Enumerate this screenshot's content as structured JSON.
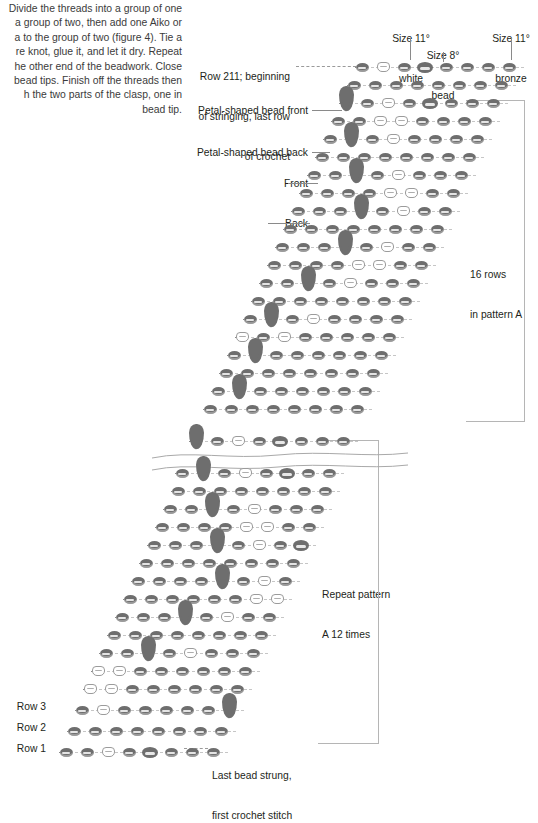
{
  "figure": {
    "instruction_paragraph": "Divide the threads into a group of one and a group of two, then add one Aiko or Delica to the group of two (figure 4). Tie a square knot, glue it, and let it dry. Repeat on the other end of the beadwork. Close the bead tips. Finish off the threads then attach the two parts of the clasp, one in each bead tip.",
    "instruction_lines": [
      "Divide the threads into a group of one",
      "a group of two, then add one Aiko or",
      "a to the group of two (figure 4). Tie a",
      "re knot, glue it, and let it dry. Repeat",
      "he other end of the beadwork. Close",
      "bead tips. Finish off the threads then",
      "h the two parts of the clasp, one in",
      "bead tip."
    ]
  },
  "legend": {
    "size11_white": {
      "line1": "Size 11°",
      "line2": "white"
    },
    "size8_bead": {
      "line1": "Size 8°",
      "line2": "bead"
    },
    "size11_bronze": {
      "line1": "Size 11°",
      "line2": "bronze"
    }
  },
  "annotations": {
    "row211": {
      "line1": "Row 211; beginning",
      "line2": "of stringing, last row",
      "line3": "of crochet"
    },
    "petal_front": "Petal-shaped bead front",
    "petal_back": "Petal-shaped bead back",
    "front": "Front",
    "back": "Back",
    "sixteen_rows": {
      "line1": "16 rows",
      "line2": "in pattern A"
    },
    "repeat_pattern": {
      "line1": "Repeat pattern",
      "line2": "A 12 times"
    },
    "last_bead": {
      "line1": "Last bead strung,",
      "line2": "first crochet stitch"
    },
    "row3": "Row 3",
    "row2": "Row 2",
    "row1": "Row 1"
  },
  "colors": {
    "bronze": "#6e6e6e",
    "white_bead_outline": "#9b9b9b",
    "text": "#231f20",
    "leader": "#8a8a8a",
    "bracket": "#b5b5b5",
    "guide_dash": "#c6c6c6"
  },
  "chart_data": {
    "type": "table",
    "bead_codes": {
      "B": "size 11 bronze",
      "W": "size 11 white",
      "E": "size 8 bead",
      "P": "petal-shaped bead"
    },
    "rows": [
      {
        "label": "Row 211",
        "x": 362,
        "y": 62,
        "beads": [
          "B",
          "W",
          "B",
          "E",
          "B",
          "B",
          "B",
          "B"
        ]
      },
      {
        "label": "",
        "x": 354,
        "y": 80,
        "beads": [
          "B",
          "B",
          "B",
          "B",
          "B",
          "B",
          "B",
          "B"
        ]
      },
      {
        "label": "",
        "x": 346,
        "y": 98,
        "beads": [
          "P",
          "B",
          "W",
          "B",
          "E",
          "B",
          "B",
          "B"
        ]
      },
      {
        "label": "",
        "x": 338,
        "y": 116,
        "beads": [
          "B",
          "B",
          "W",
          "W",
          "B",
          "B",
          "B",
          "B"
        ]
      },
      {
        "label": "",
        "x": 330,
        "y": 134,
        "beads": [
          "B",
          "P",
          "B",
          "W",
          "B",
          "B",
          "B",
          "B"
        ]
      },
      {
        "label": "",
        "x": 322,
        "y": 152,
        "beads": [
          "B",
          "B",
          "B",
          "B",
          "B",
          "B",
          "B",
          "B"
        ]
      },
      {
        "label": "",
        "x": 314,
        "y": 170,
        "beads": [
          "B",
          "B",
          "P",
          "B",
          "W",
          "B",
          "B",
          "B"
        ]
      },
      {
        "label": "",
        "x": 306,
        "y": 188,
        "beads": [
          "B",
          "B",
          "B",
          "B",
          "W",
          "W",
          "B",
          "B"
        ]
      },
      {
        "label": "",
        "x": 298,
        "y": 206,
        "beads": [
          "B",
          "B",
          "B",
          "P",
          "B",
          "W",
          "B",
          "B"
        ]
      },
      {
        "label": "",
        "x": 290,
        "y": 224,
        "beads": [
          "B",
          "B",
          "B",
          "B",
          "B",
          "B",
          "B",
          "B"
        ]
      },
      {
        "label": "",
        "x": 282,
        "y": 242,
        "beads": [
          "B",
          "B",
          "B",
          "P",
          "B",
          "W",
          "B",
          "B"
        ]
      },
      {
        "label": "",
        "x": 274,
        "y": 260,
        "beads": [
          "B",
          "B",
          "B",
          "B",
          "W",
          "W",
          "B",
          "B"
        ]
      },
      {
        "label": "",
        "x": 266,
        "y": 278,
        "beads": [
          "B",
          "B",
          "P",
          "B",
          "W",
          "B",
          "B",
          "B"
        ]
      },
      {
        "label": "",
        "x": 258,
        "y": 296,
        "beads": [
          "B",
          "B",
          "B",
          "B",
          "B",
          "B",
          "B",
          "B"
        ]
      },
      {
        "label": "",
        "x": 250,
        "y": 314,
        "beads": [
          "B",
          "P",
          "B",
          "W",
          "B",
          "B",
          "B",
          "B"
        ]
      },
      {
        "label": "",
        "x": 242,
        "y": 332,
        "beads": [
          "W",
          "B",
          "W",
          "B",
          "B",
          "B",
          "B",
          "B"
        ]
      },
      {
        "label": "",
        "x": 234,
        "y": 350,
        "beads": [
          "B",
          "P",
          "B",
          "B",
          "B",
          "B",
          "B",
          "B"
        ]
      },
      {
        "label": "",
        "x": 226,
        "y": 368,
        "beads": [
          "B",
          "B",
          "B",
          "B",
          "B",
          "B",
          "B",
          "B"
        ]
      },
      {
        "label": "",
        "x": 218,
        "y": 386,
        "beads": [
          "B",
          "P",
          "B",
          "B",
          "B",
          "B",
          "B",
          "B"
        ]
      },
      {
        "label": "",
        "x": 210,
        "y": 404,
        "beads": [
          "B",
          "B",
          "B",
          "B",
          "B",
          "B",
          "B",
          "B"
        ]
      },
      {
        "label": "",
        "x": 196,
        "y": 436,
        "beads": [
          "P",
          "B",
          "W",
          "B",
          "E",
          "B",
          "B",
          "B"
        ]
      },
      {
        "label": "",
        "x": 182,
        "y": 468,
        "beads": [
          "B",
          "P",
          "B",
          "W",
          "B",
          "E",
          "B",
          "B"
        ]
      },
      {
        "label": "",
        "x": 178,
        "y": 486,
        "beads": [
          "B",
          "B",
          "B",
          "B",
          "B",
          "B",
          "B",
          "B"
        ]
      },
      {
        "label": "",
        "x": 170,
        "y": 504,
        "beads": [
          "B",
          "B",
          "P",
          "B",
          "W",
          "B",
          "B",
          "B"
        ]
      },
      {
        "label": "",
        "x": 162,
        "y": 522,
        "beads": [
          "B",
          "B",
          "B",
          "B",
          "W",
          "W",
          "B",
          "B"
        ]
      },
      {
        "label": "",
        "x": 154,
        "y": 540,
        "beads": [
          "B",
          "B",
          "B",
          "P",
          "B",
          "W",
          "B",
          "E"
        ]
      },
      {
        "label": "",
        "x": 146,
        "y": 558,
        "beads": [
          "B",
          "B",
          "B",
          "B",
          "B",
          "B",
          "B",
          "B"
        ]
      },
      {
        "label": "",
        "x": 138,
        "y": 576,
        "beads": [
          "B",
          "B",
          "B",
          "B",
          "P",
          "B",
          "W",
          "B"
        ]
      },
      {
        "label": "",
        "x": 130,
        "y": 594,
        "beads": [
          "B",
          "B",
          "B",
          "B",
          "B",
          "B",
          "W",
          "W"
        ]
      },
      {
        "label": "",
        "x": 122,
        "y": 612,
        "beads": [
          "B",
          "B",
          "B",
          "P",
          "B",
          "W",
          "B",
          "B"
        ]
      },
      {
        "label": "",
        "x": 114,
        "y": 630,
        "beads": [
          "B",
          "B",
          "B",
          "B",
          "B",
          "B",
          "B",
          "B"
        ]
      },
      {
        "label": "",
        "x": 106,
        "y": 648,
        "beads": [
          "B",
          "B",
          "P",
          "B",
          "W",
          "B",
          "B",
          "B"
        ]
      },
      {
        "label": "",
        "x": 98,
        "y": 666,
        "beads": [
          "W",
          "W",
          "B",
          "B",
          "B",
          "B",
          "B",
          "B"
        ]
      },
      {
        "label": "",
        "x": 90,
        "y": 684,
        "beads": [
          "W",
          "W",
          "B",
          "B",
          "B",
          "B",
          "B",
          "B"
        ]
      },
      {
        "label": "Row 3",
        "x": 82,
        "y": 705,
        "beads": [
          "B",
          "W",
          "B",
          "B",
          "B",
          "B",
          "B",
          "P"
        ]
      },
      {
        "label": "Row 2",
        "x": 74,
        "y": 726,
        "beads": [
          "B",
          "B",
          "B",
          "B",
          "B",
          "B",
          "B",
          "B"
        ]
      },
      {
        "label": "Row 1",
        "x": 66,
        "y": 747,
        "beads": [
          "B",
          "B",
          "W",
          "B",
          "E",
          "B",
          "B",
          "B"
        ]
      }
    ]
  }
}
